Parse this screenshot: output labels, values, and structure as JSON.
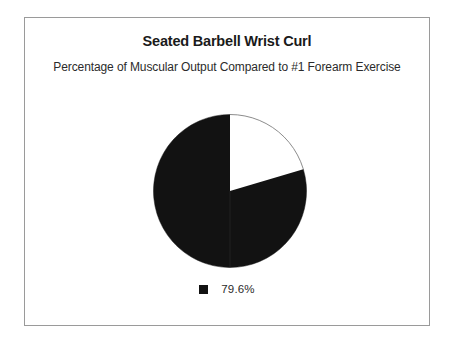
{
  "chart_data": {
    "type": "pie",
    "title": "Seated Barbell Wrist Curl",
    "subtitle": "Percentage of Muscular Output Compared to #1 Forearm Exercise",
    "categories": [
      "79.6%",
      "Remainder"
    ],
    "values": [
      79.6,
      20.4
    ],
    "value_labels": [
      "79.6%",
      ""
    ],
    "colors": [
      "#121212",
      "#ffffff"
    ],
    "slice_colors": {
      "filled": "#121212",
      "empty": "#ffffff"
    },
    "start_angle_deg": 90,
    "direction": "counterclockwise",
    "legend": {
      "position": "bottom",
      "entries": [
        {
          "label": "79.6%",
          "color": "#121212"
        }
      ]
    },
    "xlabel": "",
    "ylabel": "",
    "grid": false,
    "border_color": "#9a9a9a",
    "background": "#ffffff"
  },
  "frame": {
    "border_color": "#9a9a9a"
  }
}
